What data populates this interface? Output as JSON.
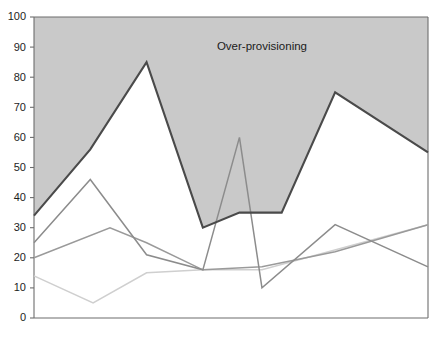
{
  "chart_data": {
    "type": "line",
    "title": "",
    "subtitle": "",
    "xlabel": "",
    "ylabel": "",
    "ylim": [
      0,
      100
    ],
    "xlim": [
      0,
      7
    ],
    "yticks": [
      0,
      10,
      20,
      30,
      40,
      50,
      60,
      70,
      80,
      90,
      100
    ],
    "ytick_labels": [
      "0",
      "10",
      "20",
      "30",
      "40",
      "50",
      "60",
      "70",
      "80",
      "90",
      "100"
    ],
    "xticks": [],
    "xtick_labels": [],
    "grid": false,
    "legend": "none",
    "annotations": [
      {
        "text": "Over-provisioning",
        "x": 4.05,
        "y": 90,
        "region": "shaded area above capacity line",
        "color": "#1b1b1b"
      }
    ],
    "shaded_regions": [
      {
        "name": "over-provisioning",
        "fill": "#c9c9c9",
        "description": "Area between the capacity line and the top of the plot (y = 100)"
      }
    ],
    "series": [
      {
        "name": "capacity",
        "role": "provisioned-capacity",
        "color": "#4a4a4a",
        "width": 2.1,
        "x": [
          0,
          1,
          2,
          3,
          3.65,
          4.4,
          5.35,
          7
        ],
        "values": [
          34,
          56,
          85,
          30,
          35,
          35,
          75,
          55
        ]
      },
      {
        "name": "demand-a",
        "role": "workload-peak",
        "color": "#8c8c8c",
        "width": 1.5,
        "x": [
          0,
          1,
          2,
          3,
          3.65,
          4.05,
          5.35,
          7
        ],
        "values": [
          25,
          46,
          21,
          16,
          60,
          10,
          31,
          17
        ]
      },
      {
        "name": "demand-b",
        "role": "workload-mid",
        "color": "#9a9a9a",
        "width": 1.5,
        "x": [
          0,
          1.35,
          2,
          3,
          4.05,
          5.35,
          7
        ],
        "values": [
          20,
          30,
          25,
          16,
          17,
          22,
          31
        ]
      },
      {
        "name": "demand-c",
        "role": "workload-base",
        "color": "#cfcfcf",
        "width": 1.5,
        "x": [
          0,
          1.05,
          2,
          3,
          4.05,
          7
        ],
        "values": [
          14,
          5,
          15,
          16,
          16,
          31
        ]
      }
    ],
    "axis_color": "#6d6d6d",
    "plot_background": "#ffffff"
  },
  "axes": {
    "left_label": "",
    "bottom_label": ""
  }
}
